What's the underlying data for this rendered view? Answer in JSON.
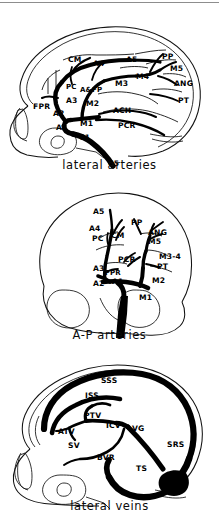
{
  "figure": {
    "panel_count": 3,
    "ink_color": "#000000",
    "background_color": "#ffffff",
    "rule_color": "#8d8d8d"
  },
  "panels": [
    {
      "id": "lateral-arteries",
      "caption": "lateral arteries",
      "view": "lateral",
      "vessel_type": "arteries",
      "labels": [
        {
          "text": "CM",
          "x": 68,
          "y": 48
        },
        {
          "text": "A4",
          "x": 93,
          "y": 52
        },
        {
          "text": "A5",
          "x": 126,
          "y": 48
        },
        {
          "text": "PP",
          "x": 162,
          "y": 45
        },
        {
          "text": "M4",
          "x": 136,
          "y": 65
        },
        {
          "text": "M5",
          "x": 170,
          "y": 57
        },
        {
          "text": "M3",
          "x": 115,
          "y": 72
        },
        {
          "text": "ANG",
          "x": 174,
          "y": 72
        },
        {
          "text": "PC",
          "x": 66,
          "y": 76
        },
        {
          "text": "A&FP",
          "x": 80,
          "y": 79
        },
        {
          "text": "PT",
          "x": 178,
          "y": 89
        },
        {
          "text": "A3",
          "x": 66,
          "y": 89
        },
        {
          "text": "M2",
          "x": 86,
          "y": 92
        },
        {
          "text": "ACH",
          "x": 113,
          "y": 99
        },
        {
          "text": "FPR",
          "x": 33,
          "y": 95
        },
        {
          "text": "A2",
          "x": 53,
          "y": 102
        },
        {
          "text": "A1",
          "x": 56,
          "y": 116
        },
        {
          "text": "M1",
          "x": 80,
          "y": 112
        },
        {
          "text": "PCR",
          "x": 118,
          "y": 114
        },
        {
          "text": "C1",
          "x": 79,
          "y": 126
        },
        {
          "text": "C5",
          "x": 108,
          "y": 152
        }
      ]
    },
    {
      "id": "ap-arteries",
      "caption": "A-P arteries",
      "view": "anterior-posterior",
      "vessel_type": "arteries",
      "labels": [
        {
          "text": "A5",
          "x": 93,
          "y": 30
        },
        {
          "text": "PP",
          "x": 131,
          "y": 41
        },
        {
          "text": "A4",
          "x": 89,
          "y": 47
        },
        {
          "text": "ANG",
          "x": 148,
          "y": 51
        },
        {
          "text": "PC",
          "x": 92,
          "y": 57
        },
        {
          "text": "CM",
          "x": 111,
          "y": 54
        },
        {
          "text": "M5",
          "x": 148,
          "y": 60
        },
        {
          "text": "M3-4",
          "x": 159,
          "y": 75
        },
        {
          "text": "PCR",
          "x": 118,
          "y": 78
        },
        {
          "text": "PT",
          "x": 157,
          "y": 85
        },
        {
          "text": "A3",
          "x": 93,
          "y": 87
        },
        {
          "text": "FPR",
          "x": 105,
          "y": 92
        },
        {
          "text": "A2",
          "x": 93,
          "y": 102
        },
        {
          "text": "A1",
          "x": 112,
          "y": 100
        },
        {
          "text": "M2",
          "x": 152,
          "y": 99
        },
        {
          "text": "M1",
          "x": 139,
          "y": 116
        }
      ]
    },
    {
      "id": "lateral-veins",
      "caption": "lateral veins",
      "view": "lateral",
      "vessel_type": "veins",
      "labels": [
        {
          "text": "SSS",
          "x": 101,
          "y": 28
        },
        {
          "text": "ISS",
          "x": 85,
          "y": 43
        },
        {
          "text": "PTV",
          "x": 84,
          "y": 63
        },
        {
          "text": "ICV",
          "x": 106,
          "y": 73
        },
        {
          "text": "VG",
          "x": 132,
          "y": 76
        },
        {
          "text": "ATV",
          "x": 58,
          "y": 79
        },
        {
          "text": "SRS",
          "x": 167,
          "y": 92
        },
        {
          "text": "SV",
          "x": 68,
          "y": 93
        },
        {
          "text": "BVR",
          "x": 97,
          "y": 105
        },
        {
          "text": "TS",
          "x": 136,
          "y": 116
        }
      ]
    }
  ],
  "legend": {
    "abbreviations": [
      "CM",
      "A1",
      "A2",
      "A3",
      "A4",
      "A5",
      "PC",
      "A&FP",
      "FPR",
      "M1",
      "M2",
      "M3",
      "M4",
      "M5",
      "M3-4",
      "PP",
      "ANG",
      "PT",
      "ACH",
      "PCR",
      "C1",
      "C5",
      "SSS",
      "ISS",
      "PTV",
      "ATV",
      "ICV",
      "VG",
      "SV",
      "BVR",
      "SRS",
      "TS"
    ]
  }
}
